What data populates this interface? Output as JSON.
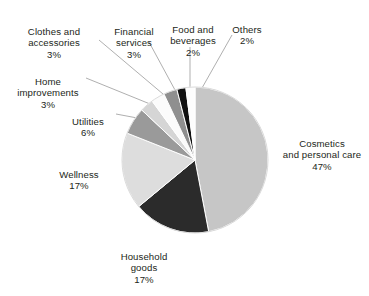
{
  "chart_data": {
    "type": "pie",
    "title": "",
    "subtitle": "",
    "xlabel": "",
    "ylabel": "",
    "legend_position": "none",
    "grid": false,
    "units": "percent",
    "total": 100,
    "start_angle_deg": 0,
    "direction": "clockwise",
    "categories": [
      "Cosmetics and personal care",
      "Household goods",
      "Wellness",
      "Utilities",
      "Home improvements",
      "Clothes and accessories",
      "Financial services",
      "Food and beverages",
      "Others"
    ],
    "values": [
      47,
      17,
      17,
      6,
      3,
      3,
      3,
      2,
      2
    ],
    "colors": [
      "#c6c6c6",
      "#2b2b2b",
      "#dddddd",
      "#9a9a9a",
      "#d5d5d5",
      "#fbfbfb",
      "#8f8f8f",
      "#111111",
      "#fdfdfd"
    ],
    "slices": [
      {
        "name": "Cosmetics and personal care",
        "value": 47,
        "color": "#c6c6c6"
      },
      {
        "name": "Household goods",
        "value": 17,
        "color": "#2b2b2b"
      },
      {
        "name": "Wellness",
        "value": 17,
        "color": "#dddddd"
      },
      {
        "name": "Utilities",
        "value": 6,
        "color": "#9a9a9a"
      },
      {
        "name": "Home improvements",
        "value": 3,
        "color": "#d5d5d5"
      },
      {
        "name": "Clothes and accessories",
        "value": 3,
        "color": "#fbfbfb"
      },
      {
        "name": "Financial services",
        "value": 3,
        "color": "#8f8f8f"
      },
      {
        "name": "Food and beverages",
        "value": 2,
        "color": "#111111"
      },
      {
        "name": "Others",
        "value": 2,
        "color": "#fdfdfd"
      }
    ]
  },
  "labels": {
    "clothes": {
      "name": "Clothes and\naccessories",
      "pct": "3%"
    },
    "financial": {
      "name": "Financial\nservices",
      "pct": "3%"
    },
    "food": {
      "name": "Food and\nbeverages",
      "pct": "2%"
    },
    "others": {
      "name": "Others",
      "pct": "2%"
    },
    "home": {
      "name": "Home\nimprovements",
      "pct": "3%"
    },
    "utilities": {
      "name": "Utilities",
      "pct": "6%"
    },
    "wellness": {
      "name": "Wellness",
      "pct": "17%"
    },
    "household": {
      "name": "Household\ngoods",
      "pct": "17%"
    },
    "cosmetics": {
      "name": "Cosmetics\nand personal care",
      "pct": "47%"
    }
  },
  "style": {
    "background": "#ffffff",
    "text_color": "#231f20",
    "leader_line_color": "#8c8c8c",
    "slice_outline": "#ffffff"
  }
}
